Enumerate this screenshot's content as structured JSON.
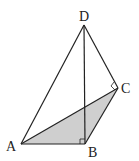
{
  "figure": {
    "type": "tetrahedron",
    "vertices": {
      "A": {
        "label": "A",
        "x": 21,
        "y": 144
      },
      "B": {
        "label": "B",
        "x": 85,
        "y": 144
      },
      "C": {
        "label": "C",
        "x": 118,
        "y": 88
      },
      "D": {
        "label": "D",
        "x": 84,
        "y": 25
      }
    },
    "shaded_face": "ABC",
    "shade_color": "#cfcfcf",
    "line_color": "#222222",
    "right_angles": [
      "DBA",
      "DCB"
    ]
  }
}
